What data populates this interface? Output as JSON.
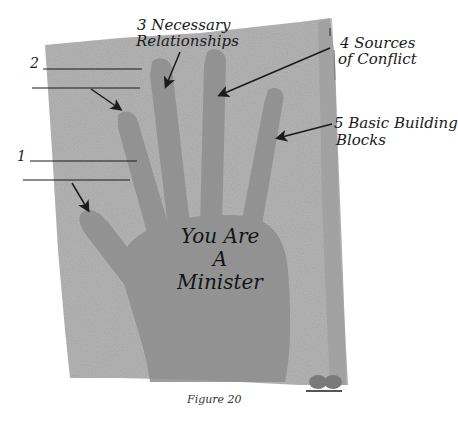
{
  "figure": {
    "caption": "Figure 20",
    "center_text": [
      "You Are",
      "A",
      "Minister"
    ],
    "colors": {
      "paper": "#b3b3b3",
      "hand": "#8f8f8f",
      "ink": "#1a1a1a",
      "background": "#ffffff"
    }
  },
  "labels": {
    "one": {
      "number": "1",
      "blanks": 2
    },
    "two": {
      "number": "2",
      "blanks": 2
    },
    "three": {
      "line1": "3 Necessary",
      "line2": "Relationships"
    },
    "four": {
      "line1": "4 Sources",
      "line2": "of Conflict"
    },
    "five": {
      "line1": "5 Basic Building",
      "line2": "Blocks"
    }
  }
}
